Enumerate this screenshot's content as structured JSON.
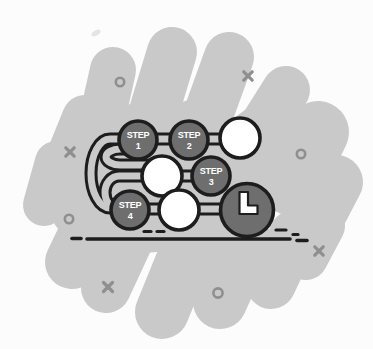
{
  "illustration": {
    "description": "Flat grayscale illustration of a four-step winding process path over a scribble blob, ending at a large node with an L glyph on a ground line",
    "colors": {
      "page_bg": "#fcfcfc",
      "blob_color": "#c9c9c9",
      "outline_color": "#1d1d1d",
      "node_fill": "#6e6e6e",
      "node_empty_fill": "#ffffff",
      "label_color": "#ffffff",
      "mark_color": "#8f8f8f"
    },
    "steps": [
      {
        "word": "STEP",
        "number": "1"
      },
      {
        "word": "STEP",
        "number": "2"
      },
      {
        "word": "STEP",
        "number": "3"
      },
      {
        "word": "STEP",
        "number": "4"
      }
    ],
    "empty_node_count": 3,
    "finish": {
      "glyph": "L"
    },
    "marks": {
      "x_count": 4,
      "o_count": 4
    }
  }
}
